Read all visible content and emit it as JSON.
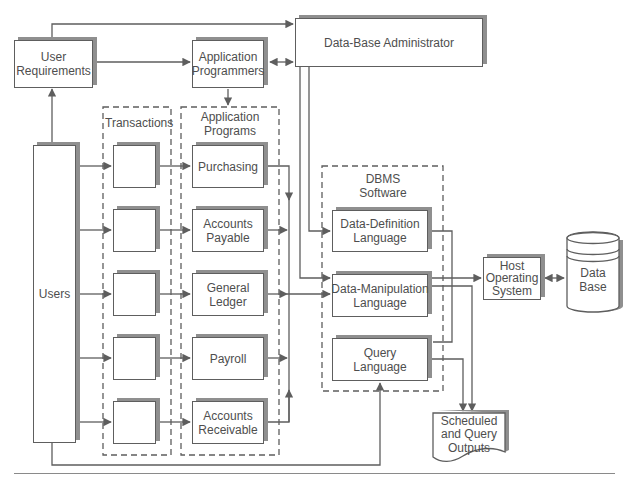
{
  "diagram": {
    "nodes": {
      "user_requirements": {
        "lines": [
          "User",
          "Requirements"
        ]
      },
      "application_programmers": {
        "lines": [
          "Application",
          "Programmers"
        ]
      },
      "dba": {
        "label": "Data-Base Administrator"
      },
      "users": {
        "label": "Users"
      },
      "transactions_group": {
        "label": "Transactions",
        "box_count": 5
      },
      "application_programs_group": {
        "lines": [
          "Application",
          "Programs"
        ]
      },
      "programs": [
        {
          "lines": [
            "Purchasing"
          ]
        },
        {
          "lines": [
            "Accounts",
            "Payable"
          ]
        },
        {
          "lines": [
            "General",
            "Ledger"
          ]
        },
        {
          "lines": [
            "Payroll"
          ]
        },
        {
          "lines": [
            "Accounts",
            "Receivable"
          ]
        }
      ],
      "dbms_group": {
        "lines": [
          "DBMS",
          "Software"
        ]
      },
      "ddl": {
        "lines": [
          "Data-Definition",
          "Language"
        ]
      },
      "dml": {
        "lines": [
          "Data-Manipulation",
          "Language"
        ]
      },
      "ql": {
        "lines": [
          "Query",
          "Language"
        ]
      },
      "host_os": {
        "lines": [
          "Host",
          "Operating",
          "System"
        ]
      },
      "database": {
        "lines": [
          "Data",
          "Base"
        ]
      },
      "outputs": {
        "lines": [
          "Scheduled",
          "and Query",
          "Outputs"
        ]
      }
    },
    "edges": [
      {
        "from": "User Requirements",
        "to": "Data-Base Administrator"
      },
      {
        "from": "User Requirements",
        "to": "Application Programmers"
      },
      {
        "from": "Application Programmers",
        "to": "Data-Base Administrator",
        "bidirectional": true
      },
      {
        "from": "Application Programmers",
        "to": "Application Programs"
      },
      {
        "from": "Users",
        "to": "User Requirements"
      },
      {
        "from": "Users",
        "to": "Transactions"
      },
      {
        "from": "Transactions",
        "to": "Application Programs"
      },
      {
        "from": "Application Programs",
        "to": "Data-Manipulation Language"
      },
      {
        "from": "Data-Base Administrator",
        "to": "Data-Definition Language"
      },
      {
        "from": "Data-Base Administrator",
        "to": "Data-Manipulation Language"
      },
      {
        "from": "DBMS Software",
        "to": "Host Operating System"
      },
      {
        "from": "Host Operating System",
        "to": "Data Base",
        "bidirectional": true
      },
      {
        "from": "Data-Manipulation Language",
        "to": "Scheduled and Query Outputs"
      },
      {
        "from": "Query Language",
        "to": "Scheduled and Query Outputs"
      },
      {
        "from": "Users",
        "to": "Query Language"
      }
    ],
    "colors": {
      "line": "#5e5e5e",
      "shadow": "#8f8f8f",
      "text": "#4e4e4e",
      "background": "#ffffff"
    }
  }
}
